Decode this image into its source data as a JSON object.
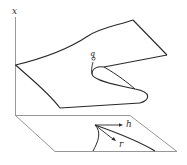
{
  "diagram": {
    "type": "cusp-catastrophe-surface",
    "labels": {
      "vertical_axis": "x",
      "fold_point": "q",
      "control_h": "h",
      "control_r": "r"
    },
    "colors": {
      "surface_line": "#2a2a2a",
      "axis_line": "#9a9a9a",
      "plane_line": "#8a8a8a",
      "background": "#ffffff"
    }
  }
}
